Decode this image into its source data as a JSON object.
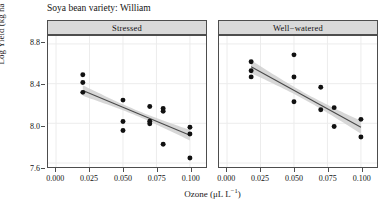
{
  "chart_data": {
    "type": "scatter",
    "title": "Soya bean variety: William",
    "xlabel": "Ozone (μL L⁻¹)",
    "ylabel": "Log Yield (kg ha⁻¹)",
    "xlim": [
      -0.006,
      0.112
    ],
    "ylim": [
      7.56,
      8.88
    ],
    "xticks": [
      0.0,
      0.025,
      0.05,
      0.075,
      0.1
    ],
    "xticklabels": [
      "0.000",
      "0.025",
      "0.050",
      "0.075",
      "0.100"
    ],
    "yticks": [
      7.6,
      8.0,
      8.4,
      8.8
    ],
    "yticklabels": [
      "7.6",
      "8.0",
      "8.4",
      "8.8"
    ],
    "grid": true,
    "legend": "none",
    "facet_variable": "water treatment",
    "panels": [
      {
        "label": "Stressed",
        "points": [
          {
            "x": 0.02,
            "y": 8.49
          },
          {
            "x": 0.02,
            "y": 8.412
          },
          {
            "x": 0.02,
            "y": 8.312
          },
          {
            "x": 0.05,
            "y": 8.234
          },
          {
            "x": 0.05,
            "y": 8.018
          },
          {
            "x": 0.05,
            "y": 7.928
          },
          {
            "x": 0.07,
            "y": 8.17
          },
          {
            "x": 0.07,
            "y": 8.022
          },
          {
            "x": 0.07,
            "y": 7.996
          },
          {
            "x": 0.08,
            "y": 8.15
          },
          {
            "x": 0.08,
            "y": 8.122
          },
          {
            "x": 0.08,
            "y": 7.79
          },
          {
            "x": 0.1,
            "y": 7.96
          },
          {
            "x": 0.1,
            "y": 7.892
          },
          {
            "x": 0.1,
            "y": 7.65
          }
        ],
        "fit": {
          "type": "linear",
          "x0": 0.02,
          "y0": 8.33,
          "x1": 0.1,
          "y1": 7.88,
          "ci_lower": [
            8.262,
            7.8
          ],
          "ci_upper": [
            8.398,
            7.96
          ],
          "ci_mid_half_width": 0.028
        }
      },
      {
        "label": "Well−watered",
        "points": [
          {
            "x": 0.018,
            "y": 8.62
          },
          {
            "x": 0.018,
            "y": 8.53
          },
          {
            "x": 0.018,
            "y": 8.468
          },
          {
            "x": 0.05,
            "y": 8.69
          },
          {
            "x": 0.05,
            "y": 8.466
          },
          {
            "x": 0.05,
            "y": 8.218
          },
          {
            "x": 0.07,
            "y": 8.364
          },
          {
            "x": 0.07,
            "y": 8.136
          },
          {
            "x": 0.08,
            "y": 8.158
          },
          {
            "x": 0.08,
            "y": 7.968
          },
          {
            "x": 0.1,
            "y": 8.04
          },
          {
            "x": 0.1,
            "y": 7.862
          }
        ],
        "fit": {
          "type": "linear",
          "x0": 0.018,
          "y0": 8.57,
          "x1": 0.1,
          "y1": 7.96,
          "ci_lower": [
            8.492,
            7.876
          ],
          "ci_upper": [
            8.648,
            8.044
          ],
          "ci_mid_half_width": 0.034
        }
      }
    ],
    "style": {
      "point_color": "#111111",
      "line_color": "#4a4a4a",
      "ci_fill": "#d0d0d0",
      "panel_bg": "#ffffff",
      "grid_color": "#ececec",
      "strip_bg": "#d9d9d9",
      "border_color": "#4d4d4d"
    }
  }
}
